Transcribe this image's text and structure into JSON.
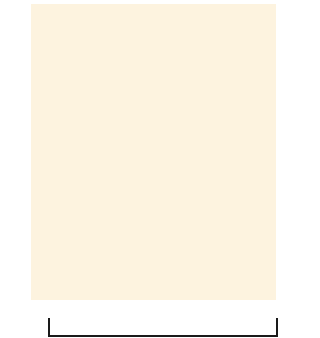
{
  "chart": {
    "title": "",
    "columns": 13,
    "rows": 16,
    "colors": {
      "edge_stitch": "#a6a8ac",
      "background_stitch": "#f8d49c",
      "grid_line": "#fdf3df",
      "contrast_dot": "#e8501f",
      "bracket": "#1a1a1a"
    },
    "row_labels_left": [
      "16",
      "14",
      "12",
      "10",
      "8",
      "6",
      "4",
      "2"
    ],
    "row_labels_right": [
      "15",
      "13",
      "11",
      "9",
      "7",
      "5",
      "3",
      "1"
    ],
    "dot_rows": {
      "16": [
        0,
        1,
        2,
        3,
        9,
        10,
        11,
        12
      ],
      "15": [
        0,
        1,
        2,
        3,
        9,
        10,
        11,
        12
      ],
      "12": [
        0,
        1,
        2,
        3,
        9,
        10,
        11,
        12
      ],
      "11": [
        0,
        1,
        2,
        3,
        9,
        10,
        11,
        12
      ],
      "8": [
        3,
        4,
        5,
        6,
        7,
        8,
        9
      ],
      "7": [
        3,
        4,
        5,
        6,
        7,
        8,
        9
      ],
      "4": [
        3,
        4,
        5,
        6,
        7,
        8,
        9
      ],
      "3": [
        3,
        4,
        5,
        6,
        7,
        8,
        9
      ]
    },
    "repeat_bracket": {
      "from_column": 1,
      "to_column": 12
    }
  }
}
